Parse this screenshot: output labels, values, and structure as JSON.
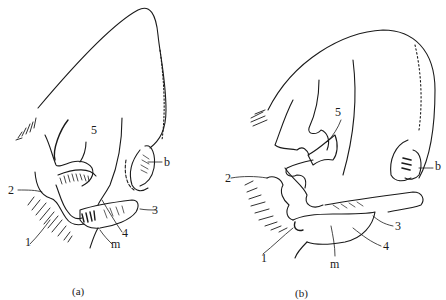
{
  "figure": {
    "panels": [
      {
        "id": "a",
        "caption": "(a)",
        "labels": {
          "l1": "1",
          "l2": "2",
          "l3": "3",
          "l4": "4",
          "l5": "5",
          "lb": "b",
          "lm": "m"
        }
      },
      {
        "id": "b",
        "caption": "(b)",
        "labels": {
          "l1": "1",
          "l2": "2",
          "l3": "3",
          "l4": "4",
          "l5": "5",
          "lb": "b",
          "lm": "m"
        }
      }
    ],
    "colors": {
      "ink": "#1a1a1a",
      "background": "#ffffff"
    }
  }
}
